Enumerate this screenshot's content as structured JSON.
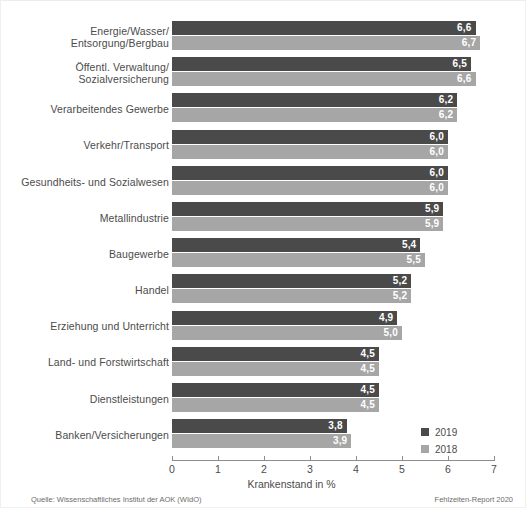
{
  "chart_data": {
    "type": "bar",
    "orientation": "horizontal",
    "title": "",
    "xlabel": "Krankenstand in %",
    "ylabel": "",
    "xlim": [
      0,
      7
    ],
    "xticks": [
      "0",
      "1",
      "2",
      "3",
      "4",
      "5",
      "6",
      "7"
    ],
    "grid": false,
    "legend_position": "bottom-right",
    "categories": [
      "Energie/Wasser/\nEntsorgung/Bergbau",
      "Öffentl. Verwaltung/\nSozialversicherung",
      "Verarbeitendes Gewerbe",
      "Verkehr/Transport",
      "Gesundheits- und Sozialwesen",
      "Metallindustrie",
      "Baugewerbe",
      "Handel",
      "Erziehung und Unterricht",
      "Land- und Forstwirtschaft",
      "Dienstleistungen",
      "Banken/Versicherungen"
    ],
    "series": [
      {
        "name": "2019",
        "color": "#4a4a4a",
        "values": [
          6.6,
          6.5,
          6.2,
          6.0,
          6.0,
          5.9,
          5.4,
          5.2,
          4.9,
          4.5,
          4.5,
          3.8
        ],
        "labels": [
          "6,6",
          "6,5",
          "6,2",
          "6,0",
          "6,0",
          "5,9",
          "5,4",
          "5,2",
          "4,9",
          "4,5",
          "4,5",
          "3,8"
        ]
      },
      {
        "name": "2018",
        "color": "#a6a6a6",
        "values": [
          6.7,
          6.6,
          6.2,
          6.0,
          6.0,
          5.9,
          5.5,
          5.2,
          5.0,
          4.5,
          4.5,
          3.9
        ],
        "labels": [
          "6,7",
          "6,6",
          "6,2",
          "6,0",
          "6,0",
          "5,9",
          "5,5",
          "5,2",
          "5,0",
          "4,5",
          "4,5",
          "3,9"
        ]
      }
    ]
  },
  "rows": [
    {
      "label_line1": "Energie/Wasser/",
      "label_line2": "Entsorgung/Bergbau",
      "v2019": "6,6",
      "v2018": "6,7",
      "w2019": 6.6,
      "w2018": 6.7
    },
    {
      "label_line1": "Öffentl. Verwaltung/",
      "label_line2": "Sozialversicherung",
      "v2019": "6,5",
      "v2018": "6,6",
      "w2019": 6.5,
      "w2018": 6.6
    },
    {
      "label_line1": "Verarbeitendes Gewerbe",
      "label_line2": "",
      "v2019": "6,2",
      "v2018": "6,2",
      "w2019": 6.2,
      "w2018": 6.2
    },
    {
      "label_line1": "Verkehr/Transport",
      "label_line2": "",
      "v2019": "6,0",
      "v2018": "6,0",
      "w2019": 6.0,
      "w2018": 6.0
    },
    {
      "label_line1": "Gesundheits- und Sozialwesen",
      "label_line2": "",
      "v2019": "6,0",
      "v2018": "6,0",
      "w2019": 6.0,
      "w2018": 6.0
    },
    {
      "label_line1": "Metallindustrie",
      "label_line2": "",
      "v2019": "5,9",
      "v2018": "5,9",
      "w2019": 5.9,
      "w2018": 5.9
    },
    {
      "label_line1": "Baugewerbe",
      "label_line2": "",
      "v2019": "5,4",
      "v2018": "5,5",
      "w2019": 5.4,
      "w2018": 5.5
    },
    {
      "label_line1": "Handel",
      "label_line2": "",
      "v2019": "5,2",
      "v2018": "5,2",
      "w2019": 5.2,
      "w2018": 5.2
    },
    {
      "label_line1": "Erziehung und Unterricht",
      "label_line2": "",
      "v2019": "4,9",
      "v2018": "5,0",
      "w2019": 4.9,
      "w2018": 5.0
    },
    {
      "label_line1": "Land- und Forstwirtschaft",
      "label_line2": "",
      "v2019": "4,5",
      "v2018": "4,5",
      "w2019": 4.5,
      "w2018": 4.5
    },
    {
      "label_line1": "Dienstleistungen",
      "label_line2": "",
      "v2019": "4,5",
      "v2018": "4,5",
      "w2019": 4.5,
      "w2018": 4.5
    },
    {
      "label_line1": "Banken/Versicherungen",
      "label_line2": "",
      "v2019": "3,8",
      "v2018": "3,9",
      "w2019": 3.8,
      "w2018": 3.9
    }
  ],
  "axis": {
    "ticks": [
      "0",
      "1",
      "2",
      "3",
      "4",
      "5",
      "6",
      "7"
    ],
    "title": "Krankenstand in %"
  },
  "legend": {
    "items": [
      {
        "label": "2019",
        "color": "#4a4a4a"
      },
      {
        "label": "2018",
        "color": "#a6a6a6"
      }
    ]
  },
  "footer": {
    "source": "Quelle: Wissenschaftliches Institut der AOK (WIdO)",
    "report": "Fehlzeiten-Report 2020"
  },
  "caption": {
    "text": ""
  },
  "colors": {
    "bar_2019": "#4a4a4a",
    "bar_2018": "#a6a6a6",
    "axis": "#8d8d8d",
    "text": "#4b4b4b"
  }
}
